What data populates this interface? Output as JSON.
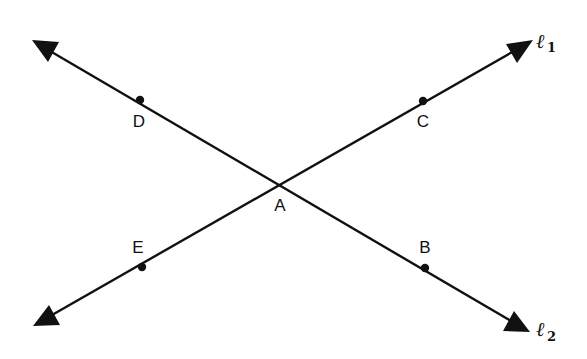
{
  "diagram": {
    "colors": {
      "stroke": "#111111",
      "background": "#ffffff"
    },
    "intersection": {
      "label": "A",
      "x": 283,
      "y": 183
    },
    "lines": [
      {
        "name": "l1",
        "label_main": "ℓ",
        "label_sub": "1",
        "from": {
          "x": 33,
          "y": 326
        },
        "to": {
          "x": 533,
          "y": 40
        }
      },
      {
        "name": "l2",
        "label_main": "ℓ",
        "label_sub": "2",
        "from": {
          "x": 32,
          "y": 40
        },
        "to": {
          "x": 530,
          "y": 332
        }
      }
    ],
    "points": [
      {
        "label": "D",
        "x": 140,
        "y": 100
      },
      {
        "label": "C",
        "x": 423,
        "y": 101
      },
      {
        "label": "A",
        "x": 283,
        "y": 183
      },
      {
        "label": "E",
        "x": 142,
        "y": 267
      },
      {
        "label": "B",
        "x": 425,
        "y": 268
      }
    ]
  }
}
